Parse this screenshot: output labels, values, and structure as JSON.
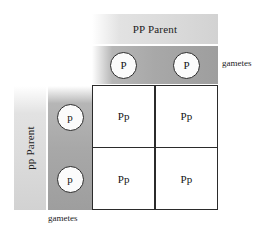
{
  "figure": {
    "top_parent": {
      "label": "PP Parent",
      "gametes": [
        "P",
        "P"
      ],
      "gametes_annotation": "gametes"
    },
    "left_parent": {
      "label": "pp Parent",
      "gametes": [
        "p",
        "p"
      ],
      "gametes_annotation": "gametes"
    },
    "grid": {
      "cells": [
        "Pp",
        "Pp",
        "Pp",
        "Pp"
      ]
    },
    "colors": {
      "parent_band": "#dcdcdc",
      "gamete_band": "#a8a8a8",
      "grid_line": "#2b2b2b",
      "cell_fill": "#ffffff",
      "text": "#141414"
    }
  }
}
